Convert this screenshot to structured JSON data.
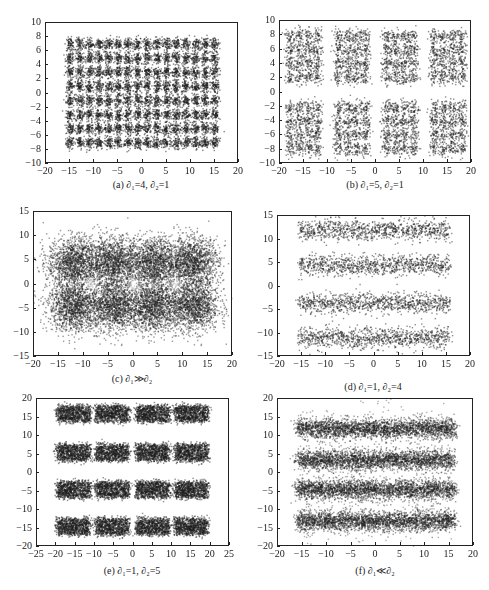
{
  "figure": {
    "panels": [
      {
        "id": "a",
        "caption": "(a) ∂₁=4, ∂₂=1"
      },
      {
        "id": "b",
        "caption": "(b) ∂₁=5, ∂₂=1"
      },
      {
        "id": "c",
        "caption": "(c) ∂₁≫∂₂"
      },
      {
        "id": "d",
        "caption": "(d) ∂₁=1, ∂₂=4"
      },
      {
        "id": "e",
        "caption": "(e) ∂₁=1, ∂₂=5"
      },
      {
        "id": "f",
        "caption": "(f) ∂₁≪∂₂"
      }
    ]
  },
  "chart_data": [
    {
      "id": "a",
      "type": "scatter",
      "title": "(a) ∂₁=4, ∂₂=1",
      "xlim": [
        -20,
        20
      ],
      "ylim": [
        -10,
        10
      ],
      "xticks": [
        -20,
        -15,
        -10,
        -5,
        0,
        5,
        10,
        15,
        20
      ],
      "yticks": [
        -10,
        -8,
        -6,
        -4,
        -2,
        0,
        2,
        4,
        6,
        8,
        10
      ],
      "description": "Dense grid of Gaussian clusters spanning x -15..15, y -7..7.5",
      "cluster_centers_x": [
        -15,
        -13,
        -11,
        -9,
        -7,
        -5,
        -3,
        -1,
        1,
        3,
        5,
        7,
        9,
        11,
        13,
        15
      ],
      "cluster_centers_y": [
        -7,
        -5,
        -3,
        -1,
        1,
        3,
        5,
        7
      ],
      "spread": 0.45,
      "xlabel": "",
      "ylabel": "",
      "grid": false
    },
    {
      "id": "b",
      "type": "scatter",
      "title": "(b) ∂₁=5, ∂₂=1",
      "xlim": [
        -20,
        20
      ],
      "ylim": [
        -10,
        10
      ],
      "xticks": [
        -20,
        -15,
        -10,
        -5,
        0,
        5,
        10,
        15,
        20
      ],
      "yticks": [
        -10,
        -8,
        -6,
        -4,
        -2,
        0,
        2,
        4,
        6,
        8,
        10
      ],
      "description": "8 blocks (4 columns x 2 rows), each a 4x4 sub-grid of clusters",
      "block_centers_x": [
        -15,
        -5,
        5,
        15
      ],
      "block_centers_y": [
        -5,
        5
      ],
      "spread": 0.55,
      "xlabel": "",
      "ylabel": "",
      "grid": false
    },
    {
      "id": "c",
      "type": "scatter",
      "title": "(c) ∂₁≫∂₂",
      "xlim": [
        -20,
        20
      ],
      "ylim": [
        -15,
        15
      ],
      "xticks": [
        -20,
        -15,
        -10,
        -5,
        0,
        5,
        10,
        15,
        20
      ],
      "yticks": [
        -15,
        -10,
        -5,
        0,
        5,
        10,
        15
      ],
      "description": "Overlapping blobs forming a 4x2 merged mass with three light holes near y=0",
      "ring_centers_x": [
        -12,
        -4,
        4,
        12
      ],
      "ring_centers_y": [
        -4.5,
        4.5
      ],
      "spread": 2.6,
      "xlabel": "",
      "ylabel": "",
      "grid": false
    },
    {
      "id": "d",
      "type": "scatter",
      "title": "(d) ∂₁=1, ∂₂=4",
      "xlim": [
        -20,
        20
      ],
      "ylim": [
        -15,
        15
      ],
      "xticks": [
        -20,
        -15,
        -10,
        -5,
        0,
        5,
        10,
        15,
        20
      ],
      "yticks": [
        -15,
        -10,
        -5,
        0,
        5,
        10,
        15
      ],
      "description": "4 horizontal bands from x -15..16 centered near y = 12, 4, -3.5, -11",
      "band_centers_y": [
        12,
        4.5,
        -3.5,
        -11
      ],
      "band_x_range": [
        -15,
        16
      ],
      "spread": 0.5,
      "xlabel": "",
      "ylabel": "",
      "grid": false
    },
    {
      "id": "e",
      "type": "scatter",
      "title": "(e) ∂₁=1, ∂₂=5",
      "xlim": [
        -25,
        25
      ],
      "ylim": [
        -20,
        20
      ],
      "xticks": [
        -25,
        -20,
        -15,
        -10,
        -5,
        0,
        5,
        10,
        15,
        20,
        25
      ],
      "yticks": [
        -20,
        -15,
        -10,
        -5,
        0,
        5,
        10,
        15,
        20
      ],
      "description": "4x4 grid of rectangular dense blocks",
      "block_centers_x": [
        -15.5,
        -5.5,
        5,
        15
      ],
      "block_centers_y": [
        16,
        5.5,
        -4.5,
        -14.5
      ],
      "spread": 1.0,
      "xlabel": "",
      "ylabel": "",
      "grid": false
    },
    {
      "id": "f",
      "type": "scatter",
      "title": "(f) ∂₁≪∂₂",
      "xlim": [
        -20,
        20
      ],
      "ylim": [
        -20,
        20
      ],
      "xticks": [
        -20,
        -15,
        -10,
        -5,
        0,
        5,
        10,
        15,
        20
      ],
      "yticks": [
        -20,
        -15,
        -10,
        -5,
        0,
        5,
        10,
        15,
        20
      ],
      "description": "4 horizontal dense bands with scattered noise, centered near y = 12, 3.5, -4.5, -13",
      "band_centers_y": [
        12,
        3.5,
        -4.5,
        -13
      ],
      "band_x_range": [
        -16,
        16
      ],
      "spread": 1.3,
      "xlabel": "",
      "ylabel": "",
      "grid": false
    }
  ]
}
